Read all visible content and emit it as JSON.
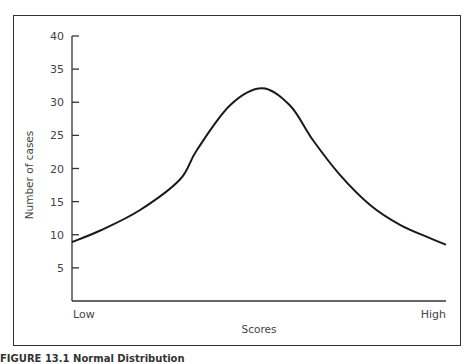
{
  "chart_data": {
    "type": "line",
    "title": "",
    "xlabel": "Scores",
    "ylabel": "Number of cases",
    "x_tick_labels": [
      "Low",
      "High"
    ],
    "y_ticks": [
      5,
      10,
      15,
      20,
      25,
      30,
      35,
      40
    ],
    "ylim": [
      0,
      40
    ],
    "grid": false,
    "legend": null,
    "series": [
      {
        "name": "Normal distribution",
        "x": [
          0,
          0.074,
          0.181,
          0.288,
          0.334,
          0.422,
          0.508,
          0.583,
          0.644,
          0.717,
          0.797,
          0.877,
          0.957,
          1.0
        ],
        "values": [
          8.9,
          10.6,
          13.7,
          18.3,
          22.8,
          29.5,
          32.1,
          29.5,
          24.3,
          19.0,
          14.5,
          11.5,
          9.5,
          8.5
        ]
      }
    ]
  },
  "labels": {
    "y_axis_title": "Number of cases",
    "x_axis_title": "Scores",
    "x_low": "Low",
    "x_high": "High",
    "caption": "FIGURE 13.1  Normal Distribution"
  }
}
